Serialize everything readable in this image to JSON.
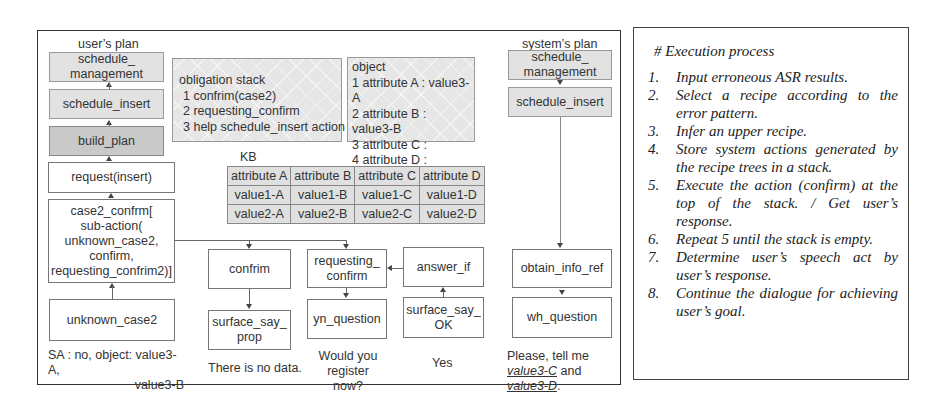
{
  "diagram": {
    "user_plan": {
      "title": "user’s plan",
      "nodes": [
        "schedule_ management",
        "schedule_insert",
        "build_plan",
        "request(insert)",
        "case2_confrm[ sub-action( unknown_case2, confirm, requesting_confrim2)]",
        "unknown_case2"
      ],
      "case2_lines": [
        "case2_confrm[",
        "sub-action(",
        "unknown_case2,",
        "confirm,",
        "requesting_confrim2)]"
      ],
      "sched_mgmt_lines": [
        "schedule_",
        "management"
      ]
    },
    "obligation_stack": {
      "title": "obligation stack",
      "items": [
        "1 confrim(case2)",
        "2 requesting_confirm",
        "3 help schedule_insert action"
      ]
    },
    "object": {
      "title": "object",
      "items": [
        "1 attribute A : value3-A",
        "2 attribute B : value3-B",
        "3 attribute C :",
        "4 attribute D :"
      ]
    },
    "kb": {
      "title": "KB",
      "headers": [
        "attribute A",
        "attribute B",
        "attribute C",
        "attribute D"
      ],
      "rows": [
        [
          "value1-A",
          "value1-B",
          "value1-C",
          "value1-D"
        ],
        [
          "value2-A",
          "value2-B",
          "value2-C",
          "value2-D"
        ]
      ]
    },
    "sub_actions": {
      "confirm": {
        "top": "confrim",
        "bottom_lines": [
          "surface_say_",
          "prop"
        ],
        "caption": "There is no data."
      },
      "requesting": {
        "top_lines": [
          "requesting_",
          "confirm"
        ],
        "bottom": "yn_question",
        "caption_lines": [
          "Would you register",
          "now?"
        ]
      },
      "answer": {
        "top": "answer_if",
        "bottom_lines": [
          "surface_say_",
          "OK"
        ],
        "caption": "Yes"
      }
    },
    "user_caption_lines": [
      "SA : no, object: value3-A,",
      "value3-B"
    ],
    "system_plan": {
      "title": "system’s plan",
      "sched_mgmt_lines": [
        "schedule_",
        "management"
      ],
      "schedule_insert": "schedule_insert",
      "obtain": "obtain_info_ref",
      "wh": "wh_question",
      "caption_pre": "Please, tell me ",
      "caption_u1": "value3-C",
      "caption_mid": " and ",
      "caption_u2": "value3-D",
      "caption_post": "."
    }
  },
  "execution_process": {
    "title": "# Execution process",
    "steps": [
      {
        "num": "1.",
        "text": "Input erroneous ASR results."
      },
      {
        "num": "2.",
        "text": "Select a recipe according to the error pattern."
      },
      {
        "num": "3.",
        "text": "Infer an upper recipe."
      },
      {
        "num": "4.",
        "text": "Store system actions generated by the recipe trees in a stack."
      },
      {
        "num": "5.",
        "text": "Execute the action (confirm) at the top of the stack. / Get user’s response."
      },
      {
        "num": "6.",
        "text": "Repeat 5 until the stack is empty."
      },
      {
        "num": "7.",
        "text": "Determine user’s speech act by user’s response."
      },
      {
        "num": "8.",
        "text": "Continue the dialogue for achieving user’s goal."
      }
    ]
  }
}
